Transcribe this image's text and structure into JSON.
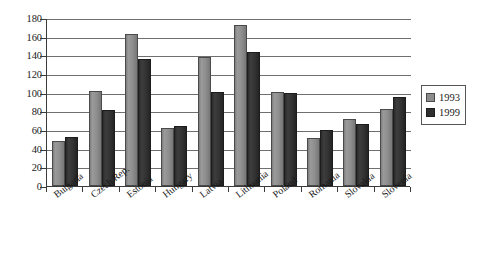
{
  "chart_data": {
    "type": "bar",
    "title": "",
    "xlabel": "",
    "ylabel": "",
    "ylim": [
      0,
      180
    ],
    "ytick_step": 20,
    "yticks": [
      180,
      160,
      140,
      120,
      100,
      80,
      60,
      40,
      20,
      0
    ],
    "grid": true,
    "legend_position": "right",
    "categories": [
      "Bulgaria",
      "Czech Rep.",
      "Estonia",
      "Hungary",
      "Latvia",
      "Lithuania",
      "Poland",
      "Romania",
      "Slovakia",
      "Slovenia"
    ],
    "series": [
      {
        "name": "1993",
        "color": "#8c8c8c",
        "values": [
          48,
          102,
          163,
          62,
          138,
          172,
          101,
          51,
          72,
          82
        ]
      },
      {
        "name": "1999",
        "color": "#2e2e2e",
        "values": [
          52,
          81,
          136,
          64,
          101,
          144,
          100,
          60,
          66,
          95
        ]
      }
    ]
  },
  "legend": {
    "entries": [
      {
        "label": "1993",
        "swatch": "series-1993-swatch"
      },
      {
        "label": "1999",
        "swatch": "series-1999-swatch"
      }
    ]
  }
}
